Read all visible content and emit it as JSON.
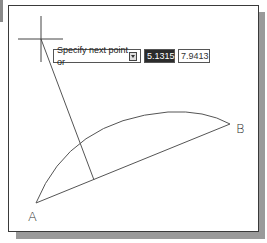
{
  "drawing": {
    "points": {
      "A": {
        "label": "A",
        "x": 36,
        "y": 203
      },
      "B": {
        "label": "B",
        "x": 230,
        "y": 124
      }
    },
    "cursor": {
      "x": 41,
      "y": 39
    }
  },
  "dynamic_input": {
    "prompt": "Specify next point or",
    "prompt_icon": "down-arrow-icon",
    "length_value": "5.1315",
    "angle_value": "7.9413"
  },
  "colors": {
    "line": "#555555",
    "frame": "#3a3a3a",
    "shadow": "#9a9a9a",
    "active_field_bg": "#2b2b2b"
  }
}
